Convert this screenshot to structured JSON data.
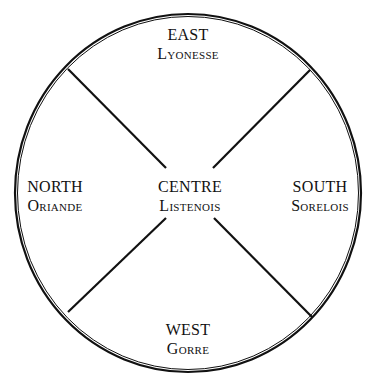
{
  "diagram": {
    "type": "quartered-circle",
    "stroke_color": "#111111",
    "background": "#ffffff",
    "regions": [
      {
        "id": "east",
        "direction": "EAST",
        "name": "Lyonesse",
        "position": "top"
      },
      {
        "id": "north",
        "direction": "NORTH",
        "name": "Oriande",
        "position": "left"
      },
      {
        "id": "centre",
        "direction": "CENTRE",
        "name": "Listenois",
        "position": "center"
      },
      {
        "id": "south",
        "direction": "SOUTH",
        "name": "Sorelois",
        "position": "right"
      },
      {
        "id": "west",
        "direction": "WEST",
        "name": "Gorre",
        "position": "bottom"
      }
    ]
  }
}
